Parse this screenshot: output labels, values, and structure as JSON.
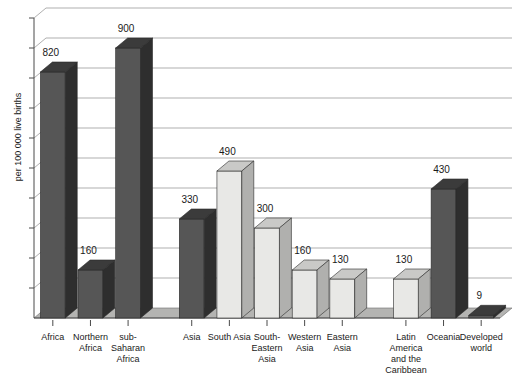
{
  "chart_data": {
    "type": "bar",
    "title": "",
    "xlabel": "",
    "ylabel": "per 100 000 live births",
    "ylim": [
      0,
      1000
    ],
    "grid": true,
    "legend": "none",
    "style": "3d-column",
    "categories": [
      "Africa",
      "Northern Africa",
      "sub-Saharan Africa",
      "Asia",
      "South Asia",
      "South-Eastern Asia",
      "Western Asia",
      "Eastern Asia",
      "Latin America and the Caribbean",
      "Oceania",
      "Developed world"
    ],
    "values": [
      820,
      160,
      900,
      330,
      490,
      300,
      160,
      130,
      130,
      430,
      9
    ],
    "value_labels": [
      "820",
      "160",
      "900",
      "330",
      "490",
      "300",
      "160",
      "130",
      "130",
      "430",
      "9"
    ],
    "category_label_lines": [
      [
        "Africa"
      ],
      [
        "Northern",
        "Africa"
      ],
      [
        "sub-",
        "Saharan",
        "Africa"
      ],
      [
        "Asia"
      ],
      [
        "South Asia"
      ],
      [
        "South-",
        "Eastern",
        "Asia"
      ],
      [
        "Western",
        "Asia"
      ],
      [
        "Eastern",
        "Asia"
      ],
      [
        "Latin",
        "America",
        "and the",
        "Caribbean"
      ],
      [
        "Oceania"
      ],
      [
        "Developed",
        "world"
      ]
    ],
    "series_shade": [
      "dark",
      "dark",
      "dark",
      "dark",
      "light",
      "light",
      "light",
      "light",
      "light",
      "dark",
      "dark"
    ],
    "groups": [
      {
        "name": "Africa",
        "member_indices": [
          0,
          1,
          2
        ]
      },
      {
        "name": "Asia",
        "member_indices": [
          3,
          4,
          5,
          6,
          7
        ]
      },
      {
        "name": "Other regions",
        "member_indices": [
          8,
          9,
          10
        ]
      }
    ],
    "gridline_count": 10,
    "gridline_values": [
      100,
      200,
      300,
      400,
      500,
      600,
      700,
      800,
      900,
      1000
    ],
    "colors": {
      "bar_dark_front": "#565656",
      "bar_dark_top": "#3b3b3b",
      "bar_dark_side": "#2e2e2e",
      "bar_light_front": "#e8e8e6",
      "bar_light_top": "#c9c9c7",
      "bar_light_side": "#b0b0ae",
      "gridline": "#8d8d8d",
      "axis": "#4a4a4a",
      "floor": "#b4b4b2",
      "background": "#ffffff",
      "text": "#1a1a1a"
    }
  }
}
